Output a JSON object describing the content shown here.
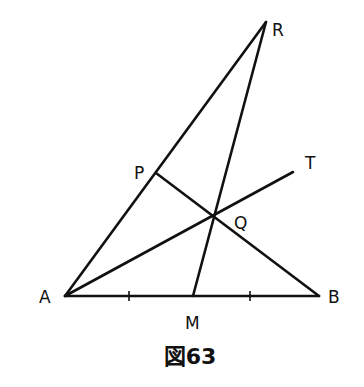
{
  "figure": {
    "caption": "図63",
    "points": {
      "A": {
        "label": "A",
        "x": 65,
        "y": 296
      },
      "B": {
        "label": "B",
        "x": 319,
        "y": 296
      },
      "R": {
        "label": "R",
        "x": 266,
        "y": 22
      },
      "P": {
        "label": "P",
        "x": 156,
        "y": 173
      },
      "Q": {
        "label": "Q",
        "x": 213,
        "y": 215
      },
      "T": {
        "label": "T",
        "x": 293,
        "y": 172
      },
      "M": {
        "label": "M",
        "x": 193,
        "y": 296
      }
    },
    "segments": [
      "AB",
      "AR",
      "RM",
      "PB",
      "AT"
    ],
    "tick_marks_on_AB": [
      129,
      250
    ],
    "colors": {
      "stroke": "#111111",
      "background": "#ffffff"
    }
  }
}
